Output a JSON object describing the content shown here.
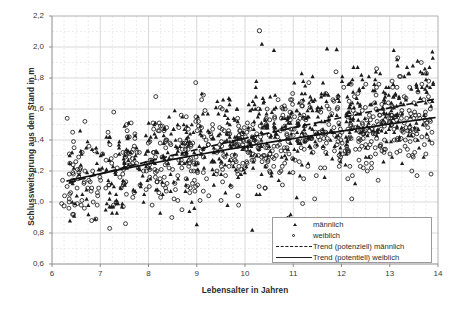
{
  "chart_data": {
    "type": "scatter",
    "title": "",
    "xlabel": "Lebensalter in Jahren",
    "ylabel": "Schlussweitsprung aus dem Stand in m",
    "xlim": [
      6,
      14
    ],
    "ylim": [
      0.6,
      2.2
    ],
    "xticks": [
      "6",
      "7",
      "8",
      "9",
      "10",
      "11",
      "12",
      "13",
      "14"
    ],
    "yticks": [
      "2,2",
      "2,0",
      "1,8",
      "1,6",
      "1,4",
      "1,2",
      "1,0",
      "0,8",
      "0,6"
    ],
    "xtick_values": [
      6,
      7,
      8,
      9,
      10,
      11,
      12,
      13,
      14
    ],
    "ytick_values": [
      2.2,
      2.0,
      1.8,
      1.6,
      1.4,
      1.2,
      1.0,
      0.8,
      0.6
    ],
    "grid": true,
    "minor_grid": true,
    "grid_color": "#d9d9d9",
    "minor_grid_color": "#ececec",
    "axis_color": "#808080",
    "marker_color": "#1c1c1c",
    "legend_position": "bottom-right",
    "legend": [
      {
        "label": "männlich",
        "key": "filled-triangle-marker"
      },
      {
        "label": "weiblich",
        "key": "open-circle-marker"
      },
      {
        "label": "Trend (potenziell) männlich",
        "key": "dashed-line"
      },
      {
        "label": "Trend (potentiell) weiblich",
        "key": "solid-line"
      }
    ],
    "series": [
      {
        "name": "männlich",
        "marker": "filled-triangle",
        "n_points": 640,
        "x_range": [
          6.3,
          13.9
        ],
        "y_range": [
          0.82,
          2.02
        ],
        "trend": {
          "type": "power",
          "style": "dashed",
          "label": "Trend (potenziell) männlich",
          "points": [
            [
              6.35,
              1.125
            ],
            [
              8.0,
              1.255
            ],
            [
              10.0,
              1.395
            ],
            [
              12.0,
              1.525
            ],
            [
              13.95,
              1.665
            ]
          ]
        }
      },
      {
        "name": "weiblich",
        "marker": "open-circle",
        "n_points": 660,
        "x_range": [
          6.2,
          13.95
        ],
        "y_range": [
          0.78,
          2.11
        ],
        "trend": {
          "type": "power",
          "style": "solid",
          "label": "Trend (potentiell) weiblich",
          "points": [
            [
              6.3,
              1.135
            ],
            [
              8.0,
              1.245
            ],
            [
              10.0,
              1.355
            ],
            [
              12.0,
              1.455
            ],
            [
              13.95,
              1.545
            ]
          ]
        }
      }
    ],
    "notable_points": [
      {
        "x": 10.3,
        "y": 2.105,
        "series": "weiblich"
      },
      {
        "x": 10.35,
        "y": 2.02,
        "series": "männlich"
      },
      {
        "x": 10.6,
        "y": 1.98,
        "series": "männlich"
      },
      {
        "x": 11.7,
        "y": 1.99,
        "series": "männlich"
      },
      {
        "x": 11.9,
        "y": 1.985,
        "series": "männlich"
      },
      {
        "x": 6.25,
        "y": 0.975,
        "series": "weiblich"
      },
      {
        "x": 9.0,
        "y": 0.855,
        "series": "männlich"
      },
      {
        "x": 10.15,
        "y": 0.82,
        "series": "männlich"
      },
      {
        "x": 10.9,
        "y": 0.895,
        "series": "weiblich"
      }
    ]
  }
}
